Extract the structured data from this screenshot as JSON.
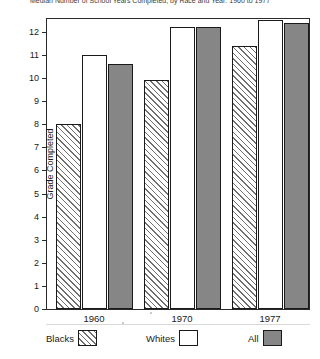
{
  "figure": {
    "title_cropped": "Median Number of School Years Completed, by Race and Year: 1960 to 1977"
  },
  "axes": {
    "ylabel": "Grade Completed",
    "xlabel": "",
    "yticks": [
      "0",
      "1",
      "2",
      "3",
      "4",
      "5",
      "6",
      "7",
      "8",
      "9",
      "10",
      "11",
      "12"
    ]
  },
  "legend": {
    "items": [
      {
        "label": "Blacks",
        "pattern": "hatched",
        "color": "#ffffff"
      },
      {
        "label": "Whites",
        "pattern": "solid",
        "color": "#ffffff"
      },
      {
        "label": "All",
        "pattern": "solid",
        "color": "#868686"
      }
    ]
  },
  "chart_data": {
    "type": "bar",
    "title": "Median Number of School Years Completed, by Race and Year: 1960 to 1977",
    "xlabel": "",
    "ylabel": "Grade Completed",
    "ylim": [
      0,
      12.6
    ],
    "yticks": [
      0,
      1,
      2,
      3,
      4,
      5,
      6,
      7,
      8,
      9,
      10,
      11,
      12
    ],
    "grid": false,
    "legend_position": "bottom",
    "categories": [
      "1960",
      "1970",
      "1977"
    ],
    "series": [
      {
        "name": "Blacks",
        "values": [
          8.0,
          9.9,
          11.4
        ]
      },
      {
        "name": "Whites",
        "values": [
          11.0,
          12.2,
          12.5
        ]
      },
      {
        "name": "All",
        "values": [
          10.6,
          12.2,
          12.4
        ]
      }
    ]
  }
}
